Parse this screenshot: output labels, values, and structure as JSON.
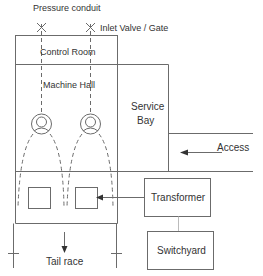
{
  "diagram": {
    "labels": {
      "pressure_conduit": "Pressure conduit",
      "inlet_valve": "Inlet Valve / Gate",
      "control_room": "Control Room",
      "machine_hall": "Machine Hall",
      "service_bay_line1": "Service",
      "service_bay_line2": "Bay",
      "access": "Access",
      "transformer": "Transformer",
      "switchyard": "Switchyard",
      "tail_race": "Tail race"
    },
    "colors": {
      "line": "#6b6b6b",
      "text": "#333333",
      "background": "#ffffff"
    },
    "units": {
      "turbine_count": 2
    }
  }
}
